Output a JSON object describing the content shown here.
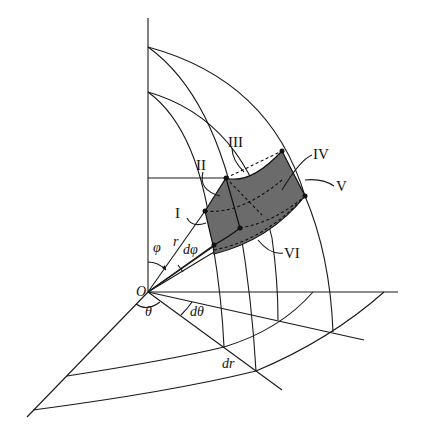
{
  "figure": {
    "title": "",
    "origin_label": "O",
    "angle_labels": {
      "phi": "φ",
      "dphi": "dφ",
      "theta": "θ",
      "dtheta": "dθ"
    },
    "length_labels": {
      "r": "r",
      "dr": "dr"
    },
    "face_labels": [
      "I",
      "II",
      "III",
      "IV",
      "V",
      "VI"
    ],
    "colors": {
      "element_fill": "#6b6b6b",
      "line": "#1a1a1a",
      "background": "#ffffff"
    }
  }
}
